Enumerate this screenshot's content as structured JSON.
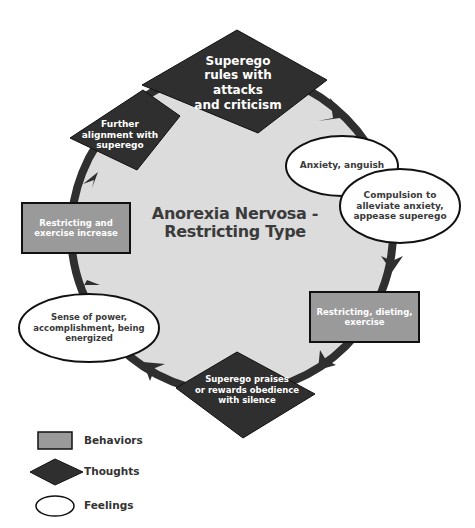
{
  "diagram": {
    "title_line1": "Anorexia Nervosa -",
    "title_line2": "Restricting Type",
    "colors": {
      "background": "#ffffff",
      "circle_fill": "#dcdcdc",
      "ring": "#2f2f2f",
      "behavior_fill": "#9a9a9a",
      "thought_fill": "#2f2f2f",
      "feeling_fill": "#ffffff",
      "outline": "#111111"
    },
    "nodes": [
      {
        "id": "superego-rules",
        "type": "thought",
        "lines": [
          "Superego",
          "rules with attacks",
          "and criticism"
        ]
      },
      {
        "id": "anxiety",
        "type": "feeling",
        "lines": [
          "Anxiety, anguish"
        ]
      },
      {
        "id": "compulsion",
        "type": "feeling",
        "lines": [
          "Compulsion to",
          "alleviate anxiety,",
          "appease superego"
        ]
      },
      {
        "id": "restricting-dieting",
        "type": "behavior",
        "lines": [
          "Restricting, dieting,",
          "exercise"
        ]
      },
      {
        "id": "superego-praises",
        "type": "thought",
        "lines": [
          "Superego praises",
          "or rewards obedience",
          "with silence"
        ]
      },
      {
        "id": "sense-of-power",
        "type": "feeling",
        "lines": [
          "Sense of power,",
          "accomplishment, being",
          "energized"
        ]
      },
      {
        "id": "restricting-increase",
        "type": "behavior",
        "lines": [
          "Restricting and",
          "exercise increase"
        ]
      },
      {
        "id": "further-alignment",
        "type": "thought",
        "lines": [
          "Further",
          "alignment with",
          "superego"
        ]
      }
    ],
    "cycle_direction": "clockwise"
  },
  "legend": {
    "items": [
      {
        "shape": "rectangle",
        "label": "Behaviors"
      },
      {
        "shape": "diamond",
        "label": "Thoughts"
      },
      {
        "shape": "ellipse",
        "label": "Feelings"
      }
    ]
  }
}
